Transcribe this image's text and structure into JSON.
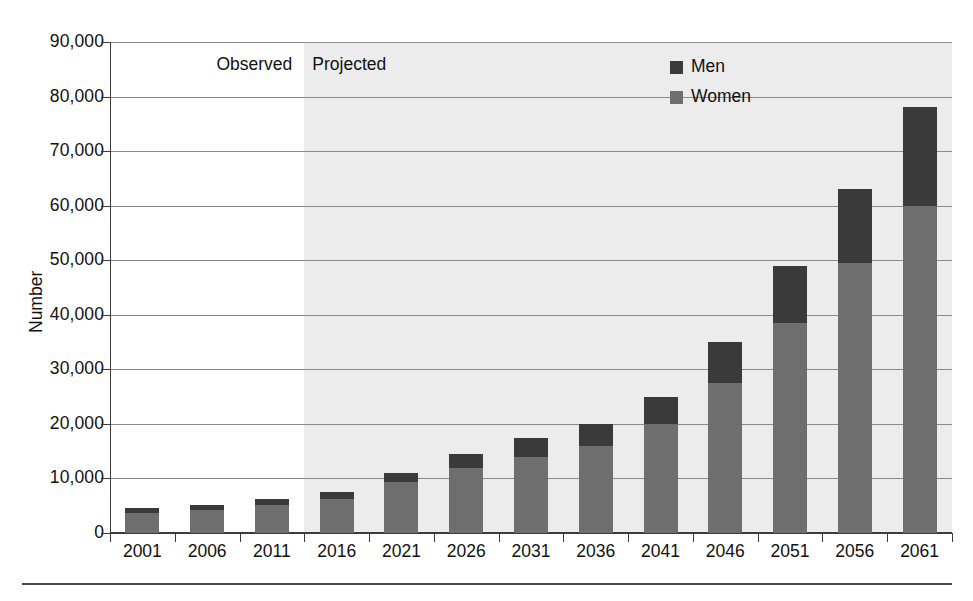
{
  "chart_data": {
    "type": "bar",
    "subtype": "stacked-column",
    "title": "",
    "xlabel": "",
    "ylabel": "Number",
    "ylim": [
      0,
      90000
    ],
    "ytick_step": 10000,
    "grid": true,
    "legend_position": "top-right",
    "categories": [
      "2001",
      "2006",
      "2011",
      "2016",
      "2021",
      "2026",
      "2031",
      "2036",
      "2041",
      "2046",
      "2051",
      "2056",
      "2061"
    ],
    "ytick_labels": [
      "0",
      "10,000",
      "20,000",
      "30,000",
      "40,000",
      "50,000",
      "60,000",
      "70,000",
      "80,000",
      "90,000"
    ],
    "series": [
      {
        "name": "Women",
        "color": "#6e6e6e",
        "values": [
          3600,
          4200,
          5100,
          6200,
          9300,
          12000,
          14000,
          16000,
          20000,
          27500,
          38500,
          49500,
          60000
        ]
      },
      {
        "name": "Men",
        "color": "#3a3a3a",
        "values": [
          900,
          1000,
          1100,
          1300,
          1700,
          2500,
          3500,
          4000,
          5000,
          7500,
          10500,
          13500,
          18000
        ]
      }
    ],
    "totals": [
      4500,
      5200,
      6200,
      7500,
      11000,
      14500,
      17500,
      20000,
      25000,
      35000,
      49000,
      63000,
      78000
    ],
    "annotations": [
      {
        "name": "observed",
        "text": "Observed",
        "span": [
          "2001",
          "2011"
        ]
      },
      {
        "name": "projected",
        "text": "Projected",
        "span": [
          "2016",
          "2061"
        ]
      }
    ],
    "shading": {
      "projected_band_color": "#ececec",
      "observed_band_color": "#ffffff"
    }
  },
  "legend": {
    "items": [
      {
        "label": "Men",
        "color": "#3a3a3a"
      },
      {
        "label": "Women",
        "color": "#6e6e6e"
      }
    ]
  },
  "axis": {
    "y_title": "Number"
  },
  "regions": {
    "observed": "Observed",
    "projected": "Projected"
  }
}
